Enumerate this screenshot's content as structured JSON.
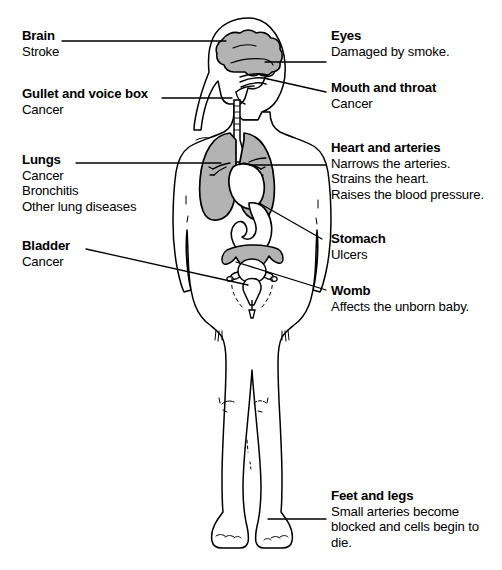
{
  "diagram": {
    "colors": {
      "organ_fill": "#b3b3b3",
      "outline": "#000000",
      "background": "#ffffff",
      "leader_line": "#000000"
    }
  },
  "callouts": {
    "brain": {
      "title": "Brain",
      "lines": [
        "Stroke"
      ]
    },
    "gullet": {
      "title": "Gullet and voice box",
      "lines": [
        "Cancer"
      ]
    },
    "lungs": {
      "title": "Lungs",
      "lines": [
        "Cancer",
        "Bronchitis",
        "Other lung diseases"
      ]
    },
    "bladder": {
      "title": "Bladder",
      "lines": [
        "Cancer"
      ]
    },
    "eyes": {
      "title": "Eyes",
      "lines": [
        "Damaged by smoke."
      ]
    },
    "mouth": {
      "title": "Mouth and throat",
      "lines": [
        "Cancer"
      ]
    },
    "heart": {
      "title": "Heart and arteries",
      "lines": [
        "Narrows the arteries.",
        "Strains the heart.",
        "Raises the blood pressure."
      ]
    },
    "stomach": {
      "title": "Stomach",
      "lines": [
        "Ulcers"
      ]
    },
    "womb": {
      "title": "Womb",
      "lines": [
        "Affects the unborn baby."
      ]
    },
    "feet": {
      "title": "Feet and legs",
      "lines": [
        "Small arteries become blocked and cells begin to die."
      ]
    }
  },
  "organs": {
    "brain": "brain-organ",
    "lungs": "lungs-organ",
    "heart": "heart-organ",
    "stomach": "stomach-organ",
    "womb": "womb-organ",
    "bladder": "bladder-organ",
    "trachea": "trachea-organ",
    "throat": "throat-organ"
  }
}
